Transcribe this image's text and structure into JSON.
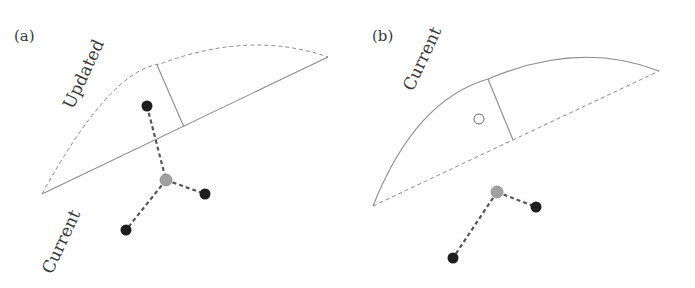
{
  "panels": [
    {
      "id": "a",
      "label": "(a)",
      "upper_curve_label": "Updated",
      "lower_line_label": "Current",
      "upper_curve_style": "dashed",
      "chord_style": "solid"
    },
    {
      "id": "b",
      "label": "(b)",
      "upper_curve_label": "Current",
      "upper_curve_style": "solid",
      "chord_style": "dashed"
    }
  ],
  "colors": {
    "line": "#8a8a8a",
    "dark_dot": "#1e1e1e",
    "gray_dot": "#a0a0a0",
    "open_dot_stroke": "#6a6a6a"
  }
}
